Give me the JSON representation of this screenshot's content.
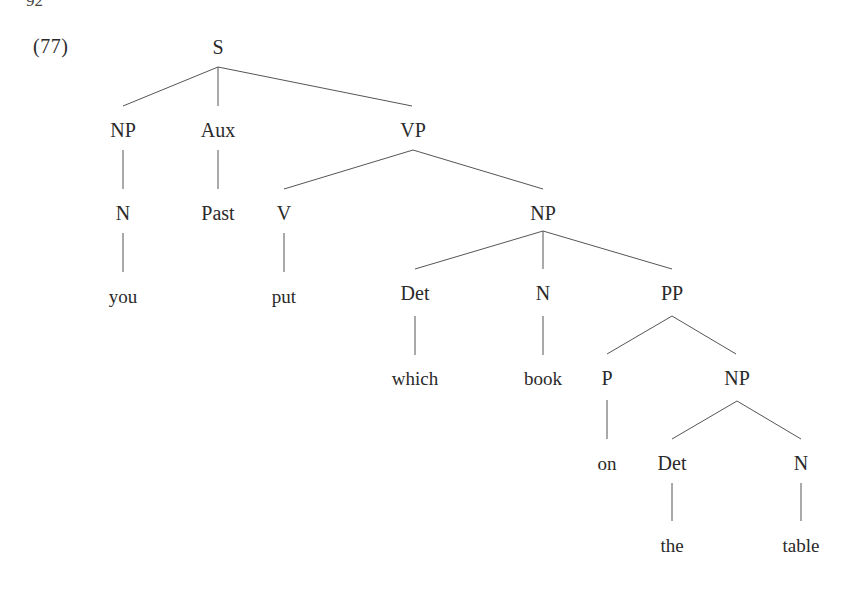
{
  "page": {
    "page_number": "92",
    "example_number": "(77)"
  },
  "tree": {
    "nodes": [
      {
        "id": "S",
        "label": "S",
        "x": 218,
        "y": 47
      },
      {
        "id": "NP1",
        "label": "NP",
        "x": 123,
        "y": 130
      },
      {
        "id": "Aux",
        "label": "Aux",
        "x": 218,
        "y": 130
      },
      {
        "id": "VP",
        "label": "VP",
        "x": 413,
        "y": 130
      },
      {
        "id": "N1",
        "label": "N",
        "x": 123,
        "y": 213
      },
      {
        "id": "Past",
        "label": "Past",
        "x": 218,
        "y": 213
      },
      {
        "id": "V",
        "label": "V",
        "x": 284,
        "y": 213
      },
      {
        "id": "NP2",
        "label": "NP",
        "x": 543,
        "y": 213
      },
      {
        "id": "you",
        "label": "you",
        "x": 123,
        "y": 296,
        "word": true
      },
      {
        "id": "put",
        "label": "put",
        "x": 284,
        "y": 296,
        "word": true
      },
      {
        "id": "Det1",
        "label": "Det",
        "x": 415,
        "y": 293
      },
      {
        "id": "N2",
        "label": "N",
        "x": 543,
        "y": 293
      },
      {
        "id": "PP",
        "label": "PP",
        "x": 672,
        "y": 293
      },
      {
        "id": "which",
        "label": "which",
        "x": 415,
        "y": 378,
        "word": true
      },
      {
        "id": "book",
        "label": "book",
        "x": 543,
        "y": 378,
        "word": true
      },
      {
        "id": "P",
        "label": "P",
        "x": 607,
        "y": 378
      },
      {
        "id": "NP3",
        "label": "NP",
        "x": 737,
        "y": 378
      },
      {
        "id": "on",
        "label": "on",
        "x": 607,
        "y": 463,
        "word": true
      },
      {
        "id": "Det2",
        "label": "Det",
        "x": 672,
        "y": 463
      },
      {
        "id": "N3",
        "label": "N",
        "x": 801,
        "y": 463
      },
      {
        "id": "the",
        "label": "the",
        "x": 672,
        "y": 545,
        "word": true
      },
      {
        "id": "table",
        "label": "table",
        "x": 801,
        "y": 545,
        "word": true
      }
    ],
    "edges": [
      {
        "from": "S",
        "to": "NP1",
        "x1": 218,
        "y1": 67,
        "x2": 123,
        "y2": 106
      },
      {
        "from": "S",
        "to": "Aux",
        "x1": 218,
        "y1": 67,
        "x2": 218,
        "y2": 106
      },
      {
        "from": "S",
        "to": "VP",
        "x1": 218,
        "y1": 67,
        "x2": 412,
        "y2": 106
      },
      {
        "from": "NP1",
        "to": "N1",
        "x1": 123,
        "y1": 150,
        "x2": 123,
        "y2": 189
      },
      {
        "from": "Aux",
        "to": "Past",
        "x1": 218,
        "y1": 150,
        "x2": 218,
        "y2": 189
      },
      {
        "from": "VP",
        "to": "V",
        "x1": 413,
        "y1": 150,
        "x2": 284,
        "y2": 189
      },
      {
        "from": "VP",
        "to": "NP2",
        "x1": 413,
        "y1": 150,
        "x2": 543,
        "y2": 189
      },
      {
        "from": "N1",
        "to": "you",
        "x1": 123,
        "y1": 233,
        "x2": 123,
        "y2": 272
      },
      {
        "from": "V",
        "to": "put",
        "x1": 284,
        "y1": 233,
        "x2": 284,
        "y2": 272
      },
      {
        "from": "NP2",
        "to": "Det1",
        "x1": 543,
        "y1": 231,
        "x2": 415,
        "y2": 269
      },
      {
        "from": "NP2",
        "to": "N2",
        "x1": 543,
        "y1": 231,
        "x2": 543,
        "y2": 269
      },
      {
        "from": "NP2",
        "to": "PP",
        "x1": 543,
        "y1": 231,
        "x2": 672,
        "y2": 269
      },
      {
        "from": "Det1",
        "to": "which",
        "x1": 415,
        "y1": 316,
        "x2": 415,
        "y2": 355
      },
      {
        "from": "N2",
        "to": "book",
        "x1": 543,
        "y1": 316,
        "x2": 543,
        "y2": 355
      },
      {
        "from": "PP",
        "to": "P",
        "x1": 672,
        "y1": 316,
        "x2": 607,
        "y2": 354
      },
      {
        "from": "PP",
        "to": "NP3",
        "x1": 672,
        "y1": 316,
        "x2": 736,
        "y2": 354
      },
      {
        "from": "P",
        "to": "on",
        "x1": 607,
        "y1": 400,
        "x2": 607,
        "y2": 439
      },
      {
        "from": "NP3",
        "to": "Det2",
        "x1": 737,
        "y1": 401,
        "x2": 672,
        "y2": 439
      },
      {
        "from": "NP3",
        "to": "N3",
        "x1": 737,
        "y1": 401,
        "x2": 801,
        "y2": 439
      },
      {
        "from": "Det2",
        "to": "the",
        "x1": 672,
        "y1": 483,
        "x2": 672,
        "y2": 521
      },
      {
        "from": "N3",
        "to": "table",
        "x1": 801,
        "y1": 483,
        "x2": 801,
        "y2": 521
      }
    ]
  }
}
